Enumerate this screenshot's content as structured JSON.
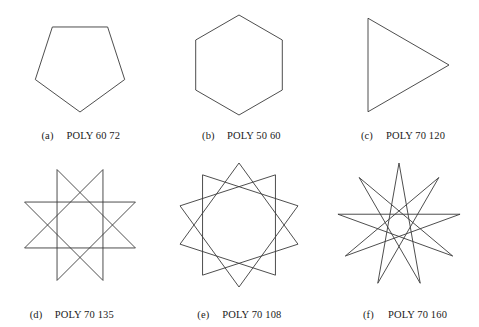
{
  "figure": {
    "background_color": "#ffffff",
    "stroke_color": "#3a3a3a",
    "layout": "2 rows x 3 columns",
    "rows": 2,
    "columns": 3
  },
  "panels": [
    {
      "tag": "(a)",
      "command": "POLY 60 72",
      "keyword": "POLY",
      "side_length": 60,
      "turn_angle": 72,
      "shape_name": "pentagon",
      "sides": 5,
      "step": 1,
      "rotation_deg": -18,
      "radius": 47,
      "center_x": 80,
      "center_y": 62
    },
    {
      "tag": "(b)",
      "command": "POLY 50 60",
      "keyword": "POLY",
      "side_length": 50,
      "turn_angle": 60,
      "shape_name": "hexagon",
      "sides": 6,
      "step": 1,
      "rotation_deg": 90,
      "radius": 50,
      "center_x": 80,
      "center_y": 62
    },
    {
      "tag": "(c)",
      "command": "POLY 70 120",
      "keyword": "POLY",
      "side_length": 70,
      "turn_angle": 120,
      "shape_name": "triangle",
      "sides": 3,
      "step": 1,
      "rotation_deg": 0,
      "radius": 54,
      "center_x": 76,
      "center_y": 62
    },
    {
      "tag": "(d)",
      "command": "POLY 70 135",
      "keyword": "POLY",
      "side_length": 70,
      "turn_angle": 135,
      "shape_name": "eight-pointed star",
      "sides": 8,
      "step": 3,
      "rotation_deg": 67.5,
      "radius": 60,
      "center_x": 80,
      "center_y": 62
    },
    {
      "tag": "(e)",
      "command": "POLY 70 108",
      "keyword": "POLY",
      "side_length": 70,
      "turn_angle": 108,
      "shape_name": "ten-pointed star",
      "sides": 10,
      "step": 3,
      "rotation_deg": 90,
      "radius": 62,
      "center_x": 80,
      "center_y": 62
    },
    {
      "tag": "(f)",
      "command": "POLY 70 160",
      "keyword": "POLY",
      "side_length": 70,
      "turn_angle": 160,
      "shape_name": "nine-pointed star",
      "sides": 9,
      "step": 4,
      "rotation_deg": 90,
      "radius": 62,
      "center_x": 80,
      "center_y": 62
    }
  ],
  "chart_data": {
    "type": "diagram",
    "title": "",
    "items": [
      {
        "label": "(a)",
        "command": "POLY 60 72",
        "vertices": 5,
        "skip": 1
      },
      {
        "label": "(b)",
        "command": "POLY 50 60",
        "vertices": 6,
        "skip": 1
      },
      {
        "label": "(c)",
        "command": "POLY 70 120",
        "vertices": 3,
        "skip": 1
      },
      {
        "label": "(d)",
        "command": "POLY 70 135",
        "vertices": 8,
        "skip": 3
      },
      {
        "label": "(e)",
        "command": "POLY 70 108",
        "vertices": 10,
        "skip": 3
      },
      {
        "label": "(f)",
        "command": "POLY 70 160",
        "vertices": 9,
        "skip": 4
      }
    ]
  }
}
